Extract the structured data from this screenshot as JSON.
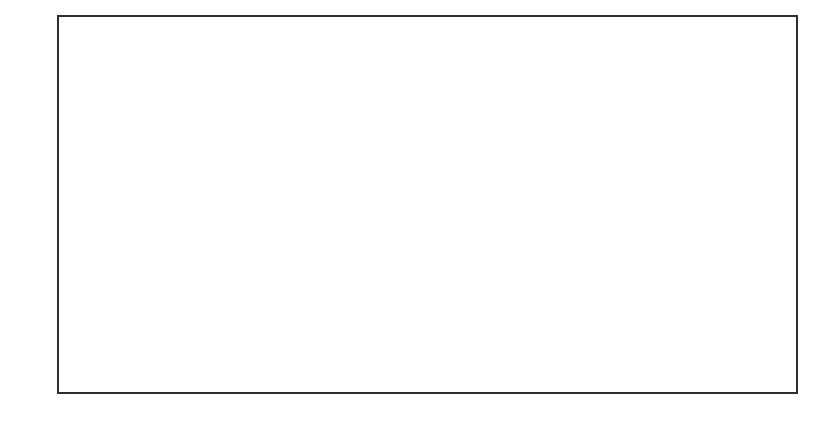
{
  "figure": {
    "type": "land-sea mask outline map (coarse grid)",
    "colors": {
      "line": "#3a3a3a",
      "background": "#ffffff"
    }
  },
  "axes": {
    "x_ticks": [
      {
        "label": "180W",
        "x": 58
      },
      {
        "label": "150W",
        "x": 118
      },
      {
        "label": "120W",
        "x": 180
      },
      {
        "label": "90W",
        "x": 241
      },
      {
        "label": "60W",
        "x": 303
      },
      {
        "label": "30W",
        "x": 365
      },
      {
        "label": "0",
        "x": 428
      },
      {
        "label": "30E",
        "x": 491
      },
      {
        "label": "60E",
        "x": 551
      },
      {
        "label": "90E",
        "x": 612
      },
      {
        "label": "120E",
        "x": 673
      },
      {
        "label": "150E",
        "x": 736
      },
      {
        "label": "180E",
        "x": 797
      }
    ],
    "y_ticks": [
      {
        "label": "60N",
        "y": 70
      },
      {
        "label": "30N",
        "y": 134
      },
      {
        "label": "0",
        "y": 199
      },
      {
        "label": "30S",
        "y": 265
      },
      {
        "label": "60S",
        "y": 329
      }
    ]
  },
  "regions": [
    {
      "name": "north-america",
      "points": "84,52 97,52 97,41 178,41 178,30 190,30 190,41 213,41 213,53 225,53 225,41 236,41 236,21 389,21 389,43 375,43 375,55 342,55 342,66 318,66 318,45 306,45 306,32 262,32 262,55 236,55 236,78 270,78 270,44 294,44 294,78 307,78 307,93 294,93 294,105 283,105 283,116 272,116 272,127 259,127 259,140 225,140 225,153 247,153 247,165 213,165 213,153 201,153 201,140 189,140 189,127 178,127 178,116 166,116 166,77 144,77 144,65 84,65"
    },
    {
      "name": "greenland-arctic",
      "points": "0,0"
    },
    {
      "name": "eurasia-africa",
      "points": "444,49 470,49 470,58 504,58 504,49 607,49 607,39 665,39 665,53 797,53 797,67 788,67 788,75 712,75 712,88 723,88 723,100 712,100 712,111 701,111 701,122 678,122 678,160 655,160 655,183 630,183 630,172 619,172 619,160 608,160 608,172 598,172 598,181 587,181 587,172 576,172 576,161 564,161 564,146 551,146 551,170 527,170 527,208 516,208 516,243 505,243 505,268 490,268 490,279 466,279 466,268 454,268 454,225 442,225 442,191 398,191 398,144 407,144 407,105 420,105 420,80 430,80 430,54 444,54"
    },
    {
      "name": "south-america",
      "points": "272,180 305,180 305,190 318,190 318,202 341,202 341,214 354,214 354,240 341,240 341,251 329,251 329,262 318,262 318,275 305,275 305,287 294,287 294,311 270,311 270,288 283,288 283,240 270,240 270,227 259,227 259,203 272,203"
    },
    {
      "name": "australia",
      "points": "685,237 711,237 711,247 735,247 735,260 745,260 745,286 735,286 735,296 710,296 710,282 665,282 665,259 675,259 675,248 685,248"
    },
    {
      "name": "antarctica",
      "points": "58,382 87,382 87,389 109,389 109,370 167,370 167,360 190,360 190,372 213,372 213,361 283,361 283,348 295,348 295,373 272,373 272,385 316,385 316,373 329,373 329,385 352,385 352,373 375,373 375,362 515,362 515,352 573,352 573,364 585,364 585,353 745,355 745,368 768,368 768,381 756,381 756,392 797,392"
    },
    {
      "name": "island-caspian",
      "points": "459,70 481,70 481,82 459,82"
    },
    {
      "name": "island-mediterranean",
      "points": "433,106 463,106 463,118 490,118 490,130 443,130 443,119 433,119"
    },
    {
      "name": "island-1",
      "points": "525,107 537,107 537,118 525,118"
    },
    {
      "name": "island-2",
      "points": "502,157 515,157 515,170 502,170"
    },
    {
      "name": "island-madagascar",
      "points": "514,244 525,244 525,255 514,255"
    },
    {
      "name": "island-3",
      "points": "631,197 642,197 642,208 631,208"
    },
    {
      "name": "island-4",
      "points": "653,198 666,198 666,222 653,222"
    },
    {
      "name": "island-5",
      "points": "710,212 722,212 722,224 710,224"
    }
  ]
}
